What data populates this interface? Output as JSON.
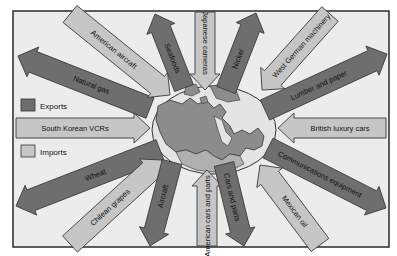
{
  "colors": {
    "background": "#ececec",
    "frame": "#2a2a2a",
    "export_fill": "#6e6e6e",
    "import_fill": "#c6c6c6",
    "arrow_stroke": "#3a3a3a",
    "map_fill": "#8c8c8c",
    "globe_fill": "#e4e4e4",
    "text": "#111111"
  },
  "legend": {
    "exports_label": "Exports",
    "imports_label": "Imports"
  },
  "arrows": [
    {
      "label": "Natural gas",
      "type": "export",
      "from": [
        150,
        108
      ],
      "to": [
        18,
        56
      ],
      "w": 22
    },
    {
      "label": "American aircraft",
      "type": "import",
      "from": [
        70,
        14
      ],
      "to": [
        170,
        95
      ],
      "w": 22
    },
    {
      "label": "Seafoods",
      "type": "export",
      "from": [
        184,
        88
      ],
      "to": [
        155,
        14
      ],
      "w": 20
    },
    {
      "label": "Japanese cameras",
      "type": "import",
      "from": [
        205,
        12
      ],
      "to": [
        205,
        90
      ],
      "w": 20
    },
    {
      "label": "Nickel",
      "type": "export",
      "from": [
        226,
        90
      ],
      "to": [
        256,
        13
      ],
      "w": 20
    },
    {
      "label": "West German machinery",
      "type": "import",
      "from": [
        330,
        14
      ],
      "to": [
        262,
        90
      ],
      "w": 22
    },
    {
      "label": "Lumber and paper",
      "type": "export",
      "from": [
        265,
        110
      ],
      "to": [
        387,
        54
      ],
      "w": 22
    },
    {
      "label": "British luxury cars",
      "type": "import",
      "from": [
        386,
        128
      ],
      "to": [
        278,
        128
      ],
      "w": 20
    },
    {
      "label": "South Korean VCRs",
      "type": "import",
      "from": [
        16,
        128
      ],
      "to": [
        150,
        128
      ],
      "w": 20
    },
    {
      "label": "Communications equipment",
      "type": "export",
      "from": [
        268,
        148
      ],
      "to": [
        386,
        208
      ],
      "w": 22
    },
    {
      "label": "Wheat",
      "type": "export",
      "from": [
        160,
        150
      ],
      "to": [
        16,
        206
      ],
      "w": 22
    },
    {
      "label": "Chilean grapes",
      "type": "import",
      "from": [
        70,
        244
      ],
      "to": [
        162,
        160
      ],
      "w": 22
    },
    {
      "label": "Aircraft",
      "type": "export",
      "from": [
        172,
        162
      ],
      "to": [
        150,
        246
      ],
      "w": 20
    },
    {
      "label": "American cars and parts",
      "type": "import",
      "from": [
        207,
        246
      ],
      "to": [
        207,
        170
      ],
      "w": 20
    },
    {
      "label": "Cars and parts",
      "type": "export",
      "from": [
        224,
        164
      ],
      "to": [
        244,
        246
      ],
      "w": 20
    },
    {
      "label": "Mexican oil",
      "type": "import",
      "from": [
        320,
        245
      ],
      "to": [
        260,
        165
      ],
      "w": 22
    }
  ],
  "map": {
    "label": "Canada map (center)",
    "center": [
      214,
      130
    ],
    "globe_rx": 62,
    "globe_ry": 44
  }
}
